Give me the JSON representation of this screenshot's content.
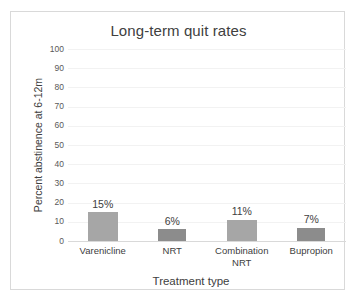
{
  "chart_data": {
    "type": "bar",
    "title": "Long-term quit rates",
    "xlabel": "Treatment type",
    "ylabel": "Percent abstinence at 6-12m",
    "categories": [
      "Varenicline",
      "NRT",
      "Combination NRT",
      "Bupropion"
    ],
    "values": [
      15,
      6,
      11,
      7
    ],
    "data_labels": [
      "15%",
      "6%",
      "11%",
      "7%"
    ],
    "ylim": [
      0,
      100
    ],
    "yticks": [
      100,
      90,
      80,
      70,
      60,
      50,
      40,
      30,
      20,
      10,
      0
    ],
    "ytick_labels": [
      "100",
      "90",
      "80",
      "70",
      "60",
      "50",
      "40",
      "30",
      "20",
      "10",
      "0"
    ],
    "grid": true,
    "legend": "none",
    "bar_colors": [
      "#a6a6a6",
      "#8c8c8c",
      "#a6a6a6",
      "#8c8c8c"
    ],
    "grid_color": "#f2f2f2",
    "axis_color": "#d9d9d9",
    "text_color": "#404040",
    "background": "#ffffff"
  }
}
